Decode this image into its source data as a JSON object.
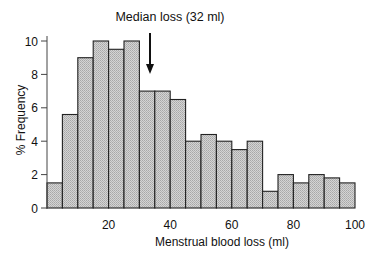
{
  "chart_data": {
    "type": "bar",
    "title": "",
    "xlabel": "Menstrual blood loss (ml)",
    "ylabel": "% Frequency",
    "xlim": [
      0,
      100
    ],
    "ylim": [
      0,
      10
    ],
    "bin_width": 5,
    "bin_edges": [
      0,
      5,
      10,
      15,
      20,
      25,
      30,
      35,
      40,
      45,
      50,
      55,
      60,
      65,
      70,
      75,
      80,
      85,
      90,
      95,
      100
    ],
    "values": [
      1.5,
      5.6,
      9.0,
      10.0,
      9.5,
      10.0,
      7.0,
      7.0,
      6.5,
      4.0,
      4.4,
      4.0,
      3.5,
      4.0,
      1.0,
      2.0,
      1.5,
      2.0,
      1.8,
      1.5
    ],
    "x_ticks": [
      20,
      40,
      60,
      80,
      100
    ],
    "y_ticks": [
      0,
      2,
      4,
      6,
      8,
      10
    ],
    "grid": false,
    "legend": null,
    "annotations": [
      {
        "text": "Median loss (32 ml)",
        "x": 32,
        "type": "arrow-down"
      }
    ]
  },
  "colors": {
    "bar_fill": "#c8c8c8",
    "bar_stroke": "#222222",
    "text": "#111111",
    "background": "#ffffff"
  }
}
